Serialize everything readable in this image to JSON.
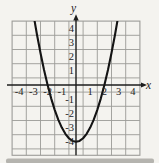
{
  "colors": {
    "paper": "#f4f3ef",
    "grid": "#9c9c98",
    "axis": "#1c1c1c",
    "curve": "#141414",
    "text": "#26241f",
    "scan_shadow": "#aeada7"
  },
  "chart_data": {
    "type": "line",
    "title": "",
    "xlabel": "x",
    "ylabel": "y",
    "xlim": [
      -4.5,
      4.5
    ],
    "ylim": [
      -4.95,
      4.5
    ],
    "grid": true,
    "x_ticks": [
      -4,
      -3,
      -2,
      -1,
      1,
      2,
      3,
      4
    ],
    "x_tick_labels": [
      "-4",
      "-3",
      "-2",
      "-1",
      "1",
      "2",
      "3",
      "4"
    ],
    "y_ticks": [
      4,
      3,
      2,
      1,
      -1,
      -2,
      -3,
      -4
    ],
    "y_tick_labels": [
      "4",
      "3",
      "2",
      "1",
      "-1",
      "-2",
      "-3",
      "-4"
    ],
    "series": [
      {
        "name": "parabola",
        "equation": "y = x^2 - 4",
        "x": [
          -2.92,
          -2.75,
          -2.5,
          -2.25,
          -2,
          -1.75,
          -1.5,
          -1.25,
          -1,
          -0.75,
          -0.5,
          -0.25,
          0,
          0.25,
          0.5,
          0.75,
          1,
          1.25,
          1.5,
          1.75,
          2,
          2.25,
          2.5,
          2.75,
          2.92
        ],
        "y": [
          4.53,
          3.56,
          2.25,
          1.06,
          0,
          -0.94,
          -1.75,
          -2.44,
          -3,
          -3.44,
          -3.75,
          -3.94,
          -4,
          -3.94,
          -3.75,
          -3.44,
          -3,
          -2.44,
          -1.75,
          -0.94,
          0,
          1.06,
          2.25,
          3.56,
          4.53
        ]
      }
    ],
    "key_points": {
      "vertex": [
        0,
        -4
      ],
      "x_intercepts": [
        [
          -2,
          0
        ],
        [
          2,
          0
        ]
      ]
    }
  }
}
